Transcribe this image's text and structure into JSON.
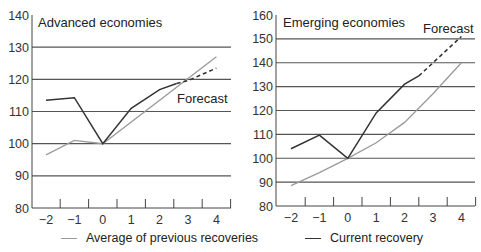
{
  "chart_data": [
    {
      "type": "line",
      "title": "Advanced economies",
      "annotation": "Forecast",
      "xlabel": "",
      "ylabel": "",
      "x": [
        -2,
        -1,
        0,
        1,
        2,
        3,
        4
      ],
      "xticks": [
        "−2",
        "−1",
        "0",
        "1",
        "2",
        "3",
        "4"
      ],
      "yticks": [
        80,
        90,
        100,
        110,
        120,
        130,
        140
      ],
      "ylim": [
        80,
        140
      ],
      "grid": "horizontal",
      "series": [
        {
          "name": "Average of previous recoveries",
          "color": "#9a9a9a",
          "points": [
            [
              -2,
              96.5
            ],
            [
              -1,
              101
            ],
            [
              0,
              100
            ],
            [
              4,
              127
            ]
          ]
        },
        {
          "name": "Current recovery",
          "color": "#333333",
          "points": [
            [
              -2,
              113.5
            ],
            [
              -1,
              114.3
            ],
            [
              0,
              100
            ],
            [
              1,
              111
            ],
            [
              2,
              116.8
            ],
            [
              2.6,
              118.7
            ]
          ]
        },
        {
          "name": "Current recovery (forecast)",
          "color": "#333333",
          "style": "dashed",
          "points": [
            [
              2.6,
              118.7
            ],
            [
              3,
              119.6
            ],
            [
              4,
              123.5
            ]
          ]
        }
      ]
    },
    {
      "type": "line",
      "title": "Emerging economies",
      "annotation": "Forecast",
      "xlabel": "",
      "ylabel": "",
      "x": [
        -2,
        -1,
        0,
        1,
        2,
        3,
        4
      ],
      "xticks": [
        "−2",
        "−1",
        "0",
        "1",
        "2",
        "3",
        "4"
      ],
      "yticks": [
        80,
        90,
        100,
        110,
        120,
        130,
        140,
        150,
        160
      ],
      "ylim": [
        80,
        160
      ],
      "grid": "horizontal",
      "series": [
        {
          "name": "Average of previous recoveries",
          "color": "#9a9a9a",
          "points": [
            [
              -2,
              88.5
            ],
            [
              -1,
              94
            ],
            [
              0,
              100
            ],
            [
              1,
              106.5
            ],
            [
              2,
              115
            ],
            [
              3,
              127
            ],
            [
              4,
              140
            ]
          ]
        },
        {
          "name": "Current recovery",
          "color": "#333333",
          "points": [
            [
              -2,
              104
            ],
            [
              -1,
              109.7
            ],
            [
              0,
              100
            ],
            [
              1,
              119
            ],
            [
              2,
              131
            ],
            [
              2.5,
              134.5
            ]
          ]
        },
        {
          "name": "Current recovery (forecast)",
          "color": "#333333",
          "style": "dashed",
          "points": [
            [
              2.5,
              134.5
            ],
            [
              4,
              151
            ]
          ]
        }
      ]
    }
  ],
  "legend": {
    "items": [
      {
        "label": "Average of previous recoveries",
        "color": "#9a9a9a"
      },
      {
        "label": "Current recovery",
        "color": "#333333"
      }
    ]
  }
}
